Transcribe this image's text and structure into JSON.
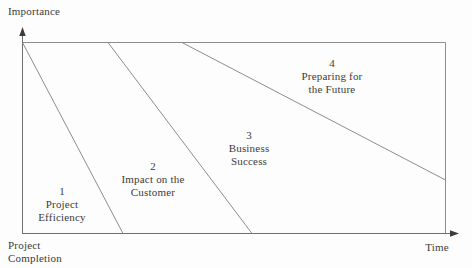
{
  "diagram": {
    "title_implicit": "",
    "y_axis_label": "Importance",
    "x_axis_label": "Time",
    "origin_label_line1": "Project",
    "origin_label_line2": "Completion",
    "regions": [
      {
        "number": "1",
        "label_line1": "Project",
        "label_line2": "Efficiency"
      },
      {
        "number": "2",
        "label_line1": "Impact on the",
        "label_line2": "Customer"
      },
      {
        "number": "3",
        "label_line1": "Business",
        "label_line2": "Success"
      },
      {
        "number": "4",
        "label_line1": "Preparing for",
        "label_line2": "the Future"
      }
    ],
    "colors": {
      "axis_line": "#6f6f6f",
      "divider_line": "#8d8d8d",
      "text": "#3b3b3b",
      "background": "#fdfdfd",
      "arrow": "#3c3c3c"
    }
  }
}
